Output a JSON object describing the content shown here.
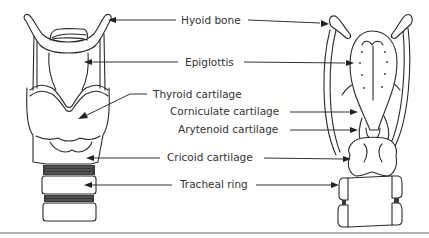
{
  "diagram": {
    "views": [
      {
        "name": "anterior-view"
      },
      {
        "name": "posterior-view"
      }
    ],
    "labels": [
      {
        "id": "hyoid",
        "text": "Hyoid bone"
      },
      {
        "id": "epiglottis",
        "text": "Epiglottis"
      },
      {
        "id": "thyroid",
        "text": "Thyroid cartilage"
      },
      {
        "id": "corniculate",
        "text": "Corniculate cartilage"
      },
      {
        "id": "arytenoid",
        "text": "Arytenoid cartilage"
      },
      {
        "id": "cricoid",
        "text": "Cricoid cartilage"
      },
      {
        "id": "tracheal",
        "text": "Tracheal ring"
      }
    ],
    "colors": {
      "line": "#2a2a2a",
      "label": "#333333",
      "rule": "#9a9a9a",
      "background": "#ffffff"
    }
  }
}
